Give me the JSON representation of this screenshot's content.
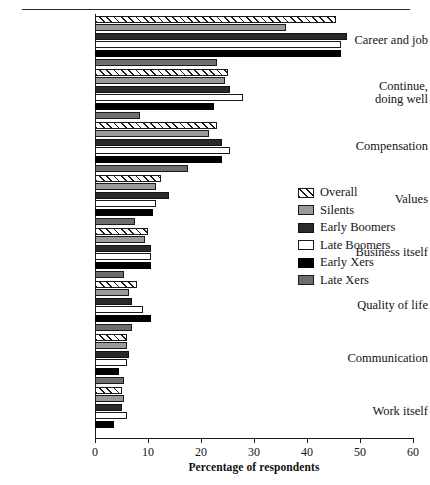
{
  "chart_data": {
    "type": "bar",
    "orientation": "horizontal",
    "title": "",
    "xlabel": "Percentage of respondents",
    "ylabel": "",
    "xlim": [
      0,
      60
    ],
    "xticks": [
      0,
      10,
      20,
      30,
      40,
      50,
      60
    ],
    "grid": false,
    "legend_position": "center-right",
    "categories": [
      "Career and job",
      "Continue, doing well",
      "Compensation",
      "Values",
      "Business itself",
      "Quality of life",
      "Communication",
      "Work itself"
    ],
    "series": [
      {
        "name": "Overall",
        "pattern": "diagonal-hatch",
        "color": "#ffffff",
        "values": [
          45.5,
          25.0,
          23.0,
          12.5,
          10.0,
          8.0,
          6.0,
          5.0
        ]
      },
      {
        "name": "Silents",
        "pattern": "solid",
        "color": "#9a9a9a",
        "values": [
          36.0,
          24.5,
          21.5,
          11.5,
          9.5,
          6.5,
          6.0,
          5.5
        ]
      },
      {
        "name": "Early Boomers",
        "pattern": "solid",
        "color": "#2a2a2a",
        "values": [
          47.5,
          25.5,
          24.0,
          14.0,
          10.5,
          7.0,
          6.5,
          5.0
        ]
      },
      {
        "name": "Late Boomers",
        "pattern": "solid",
        "color": "#ffffff",
        "values": [
          46.5,
          28.0,
          25.5,
          11.5,
          10.5,
          9.0,
          6.0,
          6.0
        ]
      },
      {
        "name": "Early Xers",
        "pattern": "solid",
        "color": "#000000",
        "values": [
          46.5,
          22.5,
          24.0,
          11.0,
          10.5,
          10.5,
          4.5,
          3.5
        ]
      },
      {
        "name": "Late Xers",
        "pattern": "solid",
        "color": "#6e6e6e",
        "values": [
          23.0,
          8.5,
          17.5,
          7.5,
          5.5,
          7.0,
          5.5,
          0.0
        ]
      }
    ]
  },
  "legend": {
    "items": [
      {
        "label": "Overall"
      },
      {
        "label": "Silents"
      },
      {
        "label": "Early Boomers"
      },
      {
        "label": "Late Boomers"
      },
      {
        "label": "Early Xers"
      },
      {
        "label": "Late Xers"
      }
    ]
  }
}
